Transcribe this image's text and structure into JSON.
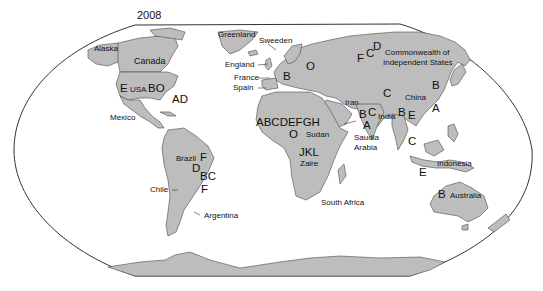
{
  "title": "2008",
  "colors": {
    "land": "#bdbdbd",
    "border": "#4a4a4a",
    "outline": "#333333",
    "ocean": "#ffffff",
    "text": "#111111"
  },
  "regions": [
    {
      "name": "Alaska",
      "codes": ""
    },
    {
      "name": "Canada",
      "codes": ""
    },
    {
      "name": "USA",
      "codes_left": "E",
      "codes_right": "BO"
    },
    {
      "name": "AD",
      "codes": "AD",
      "note": "east coast / Atlantic label"
    },
    {
      "name": "Mexico",
      "codes": ""
    },
    {
      "name": "Greenland",
      "codes": ""
    },
    {
      "name": "Sweeden",
      "codes": ""
    },
    {
      "name": "England",
      "codes": ""
    },
    {
      "name": "France",
      "codes": ""
    },
    {
      "name": "Spain",
      "codes": ""
    },
    {
      "name": "Europe",
      "codes": "B"
    },
    {
      "name": "Eastern Europe",
      "codes": "O"
    },
    {
      "name": "Commonwealth of Independent States",
      "codes_list": [
        "F",
        "C",
        "D"
      ]
    },
    {
      "name": "Iran",
      "codes": ""
    },
    {
      "name": "Saudia Arabia",
      "codes_list": [
        "B",
        "C",
        "A"
      ]
    },
    {
      "name": "India",
      "codes_list": [
        "C",
        "B",
        "E"
      ]
    },
    {
      "name": "China",
      "codes_list": [
        "B",
        "A"
      ]
    },
    {
      "name": "Southeast Asia",
      "codes_list": [
        "C",
        "E"
      ]
    },
    {
      "name": "Indonesia",
      "codes": ""
    },
    {
      "name": "Australia",
      "codes": "B"
    },
    {
      "name": "North Africa",
      "codes": "ABCDEFGH"
    },
    {
      "name": "Sudan",
      "codes": "O"
    },
    {
      "name": "Zaire",
      "codes": "JKL"
    },
    {
      "name": "South Africa",
      "codes": ""
    },
    {
      "name": "Brazil",
      "codes_list": [
        "F",
        "D",
        "BC",
        "F"
      ]
    },
    {
      "name": "Chile",
      "codes": ""
    },
    {
      "name": "Argentina",
      "codes": ""
    }
  ],
  "labels": {
    "alaska": "Alaska",
    "canada": "Canada",
    "usa_e": "E",
    "usa": "USA",
    "usa_bo": "BO",
    "ad": "AD",
    "mexico": "Mexico",
    "greenland": "Greenland",
    "sweeden": "Sweeden",
    "england": "England",
    "france": "France",
    "spain": "Spain",
    "europe_b": "B",
    "europe_o": "O",
    "cis_f": "F",
    "cis_c": "C",
    "cis_d": "D",
    "cis_line1": "Commonwealth of",
    "cis_line2": "Independent States",
    "iran": "Iran",
    "mideast_b": "B",
    "mideast_c": "C",
    "mideast_a": "A",
    "saudi_line1": "Saudia",
    "saudi_line2": "Arabia",
    "india": "India",
    "asia_c": "C",
    "india_b": "B",
    "india_e": "E",
    "china": "China",
    "china_b": "B",
    "china_a": "A",
    "sea_c": "C",
    "sea_e": "E",
    "indonesia": "Indonesia",
    "australia_b": "B",
    "australia": "Australia",
    "africa_codes": "ABCDEFGH",
    "sudan_o": "O",
    "sudan": "Sudan",
    "zaire_codes": "JKL",
    "zaire": "Zaire",
    "south_africa": "South Africa",
    "brazil": "Brazil",
    "brazil_f1": "F",
    "brazil_d": "D",
    "brazil_bc": "BC",
    "brazil_f2": "F",
    "chile": "Chile",
    "argentina": "Argentina"
  }
}
